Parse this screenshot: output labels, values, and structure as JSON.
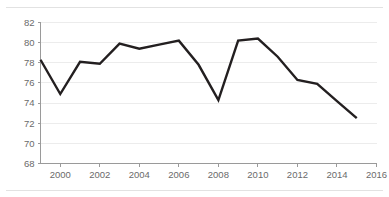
{
  "chart_data": {
    "type": "line",
    "title": "",
    "subtitle": "",
    "xlabel": "",
    "ylabel": "",
    "xlim": [
      1999,
      2016
    ],
    "ylim": [
      68,
      82
    ],
    "grid": true,
    "legend": null,
    "legend_position": "none",
    "line_color": "#231f20",
    "grid_color": "#ececec",
    "axis_color": "#9a9a9a",
    "tick_label_color": "#6a6a6a",
    "x": [
      1999,
      2000,
      2001,
      2002,
      2003,
      2004,
      2005,
      2006,
      2007,
      2008,
      2009,
      2010,
      2011,
      2012,
      2013,
      2014,
      2015
    ],
    "values": [
      78.3,
      74.9,
      78.1,
      77.9,
      79.9,
      79.4,
      79.8,
      80.2,
      77.8,
      74.3,
      80.2,
      80.4,
      78.6,
      76.3,
      75.9,
      74.2,
      72.5
    ],
    "series": [
      {
        "name": "series-1",
        "values": [
          78.3,
          74.9,
          78.1,
          77.9,
          79.9,
          79.4,
          79.8,
          80.2,
          77.8,
          74.3,
          80.2,
          80.4,
          78.6,
          76.3,
          75.9,
          74.2,
          72.5
        ]
      }
    ],
    "y_ticks": [
      68,
      70,
      72,
      74,
      76,
      78,
      80,
      82
    ],
    "y_tick_labels": [
      "68",
      "70",
      "72",
      "74",
      "76",
      "78",
      "80",
      "82"
    ],
    "x_ticks": [
      2000,
      2002,
      2004,
      2006,
      2008,
      2010,
      2012,
      2014,
      2016
    ],
    "x_tick_labels": [
      "2000",
      "2002",
      "2004",
      "2006",
      "2008",
      "2010",
      "2012",
      "2014",
      "2016"
    ]
  }
}
